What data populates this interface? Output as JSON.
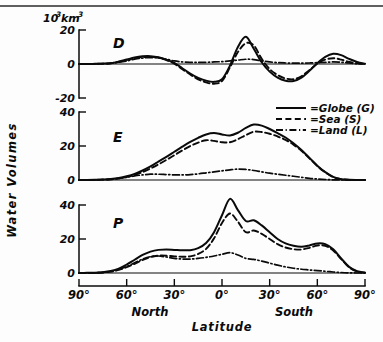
{
  "figure": {
    "y_axis_title": "Water Volumes",
    "x_axis_title": "Latitude",
    "unit_label": "10³km³",
    "unit_base": "10",
    "unit_exp": "3",
    "unit_tail": "km",
    "unit_tail_exp": "3",
    "hemisphere_left": "North",
    "hemisphere_right": "South"
  },
  "legend": {
    "position": "upper-right",
    "items": [
      {
        "label": "=Globe (G)",
        "style": "solid",
        "name": "globe"
      },
      {
        "label": "=Sea  (S)",
        "style": "dashed",
        "name": "sea"
      },
      {
        "label": "=Land (L)",
        "style": "dashdot",
        "name": "land"
      }
    ]
  },
  "x_axis": {
    "tick_labels": [
      "90°",
      "60°",
      "30°",
      "0°",
      "30°",
      "60°",
      "90°"
    ],
    "tick_values": [
      90,
      60,
      30,
      0,
      -30,
      -60,
      -90
    ],
    "range": [
      90,
      -90
    ],
    "grid": false
  },
  "panels": [
    {
      "key": "D",
      "letter": "D",
      "ylim": [
        -30,
        22
      ],
      "yticks": [
        20,
        0,
        -20
      ],
      "ytick_labels": [
        "20",
        "0",
        "-20"
      ]
    },
    {
      "key": "E",
      "letter": "E",
      "ylim": [
        0,
        45
      ],
      "yticks": [
        40,
        20,
        0
      ],
      "ytick_labels": [
        "40",
        "20",
        "0"
      ]
    },
    {
      "key": "P",
      "letter": "P",
      "ylim": [
        0,
        48
      ],
      "yticks": [
        40,
        20,
        0
      ],
      "ytick_labels": [
        "40",
        "20",
        "0"
      ]
    }
  ],
  "chart_data": [
    {
      "type": "line",
      "title": "D",
      "subtitle": "Difference (P minus E) of water volumes by latitude",
      "xlabel": "Latitude",
      "ylabel": "Water Volumes",
      "unit": "10^3 km^3",
      "xlim": [
        90,
        -90
      ],
      "ylim": [
        -30,
        22
      ],
      "yticks": [
        20,
        0,
        -20
      ],
      "grid": false,
      "legend": "upper right",
      "x": [
        90,
        85,
        80,
        75,
        70,
        65,
        60,
        55,
        50,
        45,
        40,
        35,
        30,
        25,
        20,
        15,
        10,
        5,
        0,
        -5,
        -10,
        -15,
        -20,
        -25,
        -30,
        -35,
        -40,
        -45,
        -50,
        -55,
        -60,
        -65,
        -70,
        -75,
        -80,
        -85,
        -90
      ],
      "series": [
        {
          "name": "Globe (G)",
          "style": "solid",
          "values": [
            0.0,
            0.0,
            0.1,
            0.2,
            0.5,
            1.4,
            2.6,
            3.8,
            4.5,
            4.6,
            4.0,
            2.6,
            0.6,
            -2.5,
            -5.6,
            -8.2,
            -9.8,
            -10.5,
            -9.0,
            -1.0,
            10.0,
            16.0,
            9.0,
            1.0,
            -4.5,
            -8.0,
            -9.8,
            -10.0,
            -8.0,
            -4.0,
            0.5,
            4.2,
            6.0,
            5.2,
            3.0,
            1.2,
            0.2
          ]
        },
        {
          "name": "Sea (S)",
          "style": "dashed",
          "values": [
            0.0,
            0.0,
            0.1,
            0.2,
            0.5,
            1.3,
            2.4,
            3.4,
            4.0,
            4.2,
            3.7,
            2.3,
            0.2,
            -3.0,
            -6.2,
            -9.0,
            -10.8,
            -11.6,
            -10.0,
            -2.0,
            7.0,
            12.2,
            11.0,
            3.0,
            -3.0,
            -6.5,
            -8.5,
            -9.0,
            -7.2,
            -3.6,
            0.2,
            2.6,
            3.4,
            2.6,
            1.2,
            0.4,
            0.1
          ]
        },
        {
          "name": "Land (L)",
          "style": "dashdot",
          "values": [
            0.0,
            0.0,
            0.1,
            0.2,
            0.4,
            1.0,
            1.8,
            2.8,
            3.5,
            3.8,
            3.6,
            2.8,
            1.8,
            1.2,
            1.0,
            1.0,
            1.0,
            1.2,
            1.4,
            1.8,
            2.3,
            2.8,
            2.6,
            1.8,
            1.2,
            0.8,
            0.6,
            0.5,
            0.5,
            0.6,
            0.8,
            1.0,
            1.2,
            1.0,
            0.6,
            0.2,
            0.0
          ]
        }
      ]
    },
    {
      "type": "line",
      "title": "E",
      "subtitle": "Evaporation water volumes by latitude",
      "xlabel": "Latitude",
      "ylabel": "Water Volumes",
      "unit": "10^3 km^3",
      "xlim": [
        90,
        -90
      ],
      "ylim": [
        0,
        45
      ],
      "yticks": [
        40,
        20,
        0
      ],
      "grid": false,
      "legend": "upper right",
      "x": [
        90,
        85,
        80,
        75,
        70,
        65,
        60,
        55,
        50,
        45,
        40,
        35,
        30,
        25,
        20,
        15,
        10,
        5,
        0,
        -5,
        -10,
        -15,
        -20,
        -25,
        -30,
        -35,
        -40,
        -45,
        -50,
        -55,
        -60,
        -65,
        -70,
        -75,
        -80,
        -85,
        -90
      ],
      "series": [
        {
          "name": "Globe (G)",
          "style": "solid",
          "values": [
            0.0,
            0.0,
            0.1,
            0.3,
            0.6,
            1.2,
            2.2,
            3.6,
            5.6,
            8.0,
            10.8,
            13.6,
            16.6,
            19.6,
            22.4,
            24.8,
            26.8,
            27.6,
            26.8,
            26.2,
            27.8,
            30.6,
            32.6,
            32.0,
            30.0,
            27.6,
            25.0,
            21.6,
            17.6,
            13.0,
            8.4,
            4.6,
            1.8,
            0.5,
            0.1,
            0.0,
            0.0
          ]
        },
        {
          "name": "Sea (S)",
          "style": "dashed",
          "values": [
            0.0,
            0.0,
            0.1,
            0.2,
            0.4,
            0.9,
            1.7,
            2.9,
            4.6,
            6.8,
            9.2,
            11.8,
            14.6,
            17.4,
            20.0,
            22.0,
            23.4,
            23.0,
            22.2,
            22.2,
            24.0,
            26.4,
            28.4,
            28.2,
            27.2,
            25.6,
            23.6,
            20.8,
            17.2,
            12.8,
            8.2,
            4.5,
            1.7,
            0.5,
            0.1,
            0.0,
            0.0
          ]
        },
        {
          "name": "Land (L)",
          "style": "dashdot",
          "values": [
            0.0,
            0.0,
            0.1,
            0.2,
            0.4,
            0.9,
            1.6,
            2.4,
            3.0,
            3.4,
            3.4,
            3.2,
            3.0,
            3.0,
            3.2,
            3.6,
            4.2,
            4.8,
            5.4,
            6.0,
            6.4,
            6.2,
            5.6,
            4.8,
            4.0,
            3.4,
            2.8,
            2.2,
            1.6,
            1.0,
            0.6,
            0.3,
            0.1,
            0.0,
            0.0,
            0.0,
            0.0
          ]
        }
      ]
    },
    {
      "type": "line",
      "title": "P",
      "subtitle": "Precipitation water volumes by latitude",
      "xlabel": "Latitude",
      "ylabel": "Water Volumes",
      "unit": "10^3 km^3",
      "xlim": [
        90,
        -90
      ],
      "ylim": [
        0,
        48
      ],
      "yticks": [
        40,
        20,
        0
      ],
      "grid": false,
      "legend": "upper right",
      "x": [
        90,
        85,
        80,
        75,
        70,
        65,
        60,
        55,
        50,
        45,
        40,
        35,
        30,
        25,
        20,
        15,
        10,
        5,
        0,
        -5,
        -10,
        -15,
        -20,
        -25,
        -30,
        -35,
        -40,
        -45,
        -50,
        -55,
        -60,
        -65,
        -70,
        -75,
        -80,
        -85,
        -90
      ],
      "series": [
        {
          "name": "Globe (G)",
          "style": "solid",
          "values": [
            0.0,
            0.1,
            0.2,
            0.5,
            1.2,
            2.6,
            5.0,
            7.8,
            10.6,
            12.6,
            13.6,
            13.8,
            13.6,
            13.4,
            13.4,
            14.6,
            17.6,
            24.0,
            34.0,
            43.6,
            37.0,
            30.6,
            31.0,
            28.0,
            24.0,
            20.0,
            17.4,
            16.0,
            15.4,
            16.2,
            17.4,
            17.0,
            14.0,
            8.6,
            3.6,
            1.0,
            0.2
          ]
        },
        {
          "name": "Sea (S)",
          "style": "dashed",
          "values": [
            0.0,
            0.0,
            0.1,
            0.3,
            0.8,
            1.8,
            3.4,
            5.4,
            7.6,
            9.4,
            10.2,
            10.2,
            9.8,
            9.6,
            9.8,
            11.2,
            14.2,
            20.4,
            29.4,
            35.0,
            30.2,
            24.0,
            25.0,
            23.0,
            20.0,
            17.0,
            15.0,
            14.0,
            13.8,
            14.8,
            16.2,
            16.0,
            13.2,
            8.2,
            3.4,
            0.9,
            0.2
          ]
        },
        {
          "name": "Land (L)",
          "style": "dashdot",
          "values": [
            0.0,
            0.0,
            0.1,
            0.3,
            0.9,
            2.0,
            3.8,
            6.0,
            8.2,
            9.6,
            10.0,
            9.4,
            8.6,
            8.2,
            8.2,
            8.6,
            9.2,
            10.0,
            11.0,
            12.0,
            10.6,
            8.6,
            8.0,
            7.0,
            5.8,
            4.6,
            3.6,
            2.8,
            2.2,
            1.8,
            1.4,
            1.0,
            0.6,
            0.3,
            0.1,
            0.0,
            0.0
          ]
        }
      ]
    }
  ]
}
